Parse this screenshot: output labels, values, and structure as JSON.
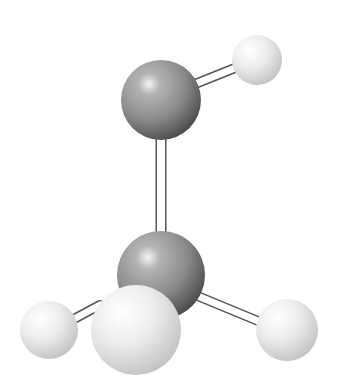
{
  "diagram": {
    "type": "ball-and-stick molecular model",
    "molecule": "methanol",
    "atoms": [
      {
        "id": "O",
        "element": "O",
        "cx": 161,
        "cy": 100,
        "r": 40,
        "color": "#8a8a8a"
      },
      {
        "id": "Ho",
        "element": "H",
        "cx": 257,
        "cy": 60,
        "r": 25,
        "color": "#e6e6e6"
      },
      {
        "id": "C",
        "element": "C",
        "cx": 161,
        "cy": 275,
        "r": 44,
        "color": "#8a8a8a"
      },
      {
        "id": "H1",
        "element": "H",
        "cx": 49,
        "cy": 330,
        "r": 29,
        "color": "#e6e6e6"
      },
      {
        "id": "H2",
        "element": "H",
        "cx": 136,
        "cy": 330,
        "r": 45,
        "color": "#e6e6e6"
      },
      {
        "id": "H3",
        "element": "H",
        "cx": 287,
        "cy": 330,
        "r": 31,
        "color": "#e6e6e6"
      }
    ],
    "bonds": [
      {
        "from": "O",
        "to": "Ho"
      },
      {
        "from": "O",
        "to": "C"
      },
      {
        "from": "C",
        "to": "H1"
      },
      {
        "from": "C",
        "to": "H2"
      },
      {
        "from": "C",
        "to": "H3"
      }
    ],
    "colors": {
      "heavy_atom": "#8a8a8a",
      "hydrogen": "#e6e6e6",
      "bond_fill": "#ffffff",
      "bond_outline": "#555555",
      "background": "#ffffff"
    }
  }
}
